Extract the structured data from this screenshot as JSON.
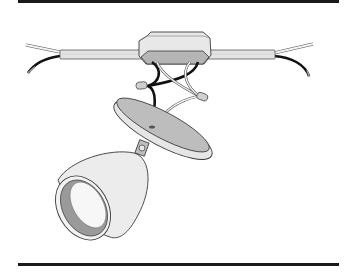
{
  "figure": {
    "caption": "",
    "subject": "Spotlight fixture wiring: cable through junction box, wires connected to fixture base plate, adjustable lamp head",
    "parts": [
      {
        "id": "cable",
        "name": "sheathed-cable"
      },
      {
        "id": "junction-box",
        "name": "octagonal-junction-box"
      },
      {
        "id": "wire-connectors",
        "name": "twist-on-wire-connectors"
      },
      {
        "id": "base-plate",
        "name": "fixture-mounting-plate"
      },
      {
        "id": "lamp-head",
        "name": "spotlight-lamp-head"
      }
    ]
  },
  "colors": {
    "rule": "#1a1a1a",
    "outline": "#3a3a3a",
    "fill_light": "#e6e6e6",
    "fill_mid": "#bdbdbd",
    "fill_dark": "#9a9a9a",
    "wire_black": "#111111",
    "wire_white": "#f4f4f4",
    "background": "#ffffff"
  }
}
